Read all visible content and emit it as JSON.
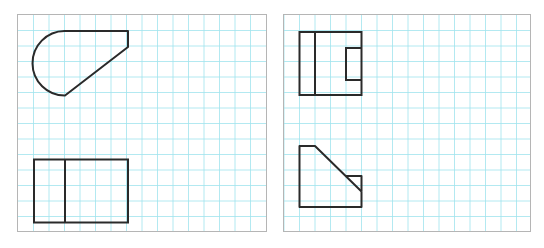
{
  "diagram": {
    "type": "orthographic-projection-views",
    "colors": {
      "grid": "#9fe3ee",
      "outline": "#2a2a2a",
      "border": "#b5b5b5",
      "background": "#ffffff"
    },
    "grid_spacing_px": 15.5,
    "panels": [
      {
        "name": "left-panel",
        "views": [
          {
            "name": "top-view",
            "shape": "semicircle-plus-tapered-wedge"
          },
          {
            "name": "front-view",
            "shape": "rectangle-with-vertical-divider"
          }
        ]
      },
      {
        "name": "right-panel",
        "views": [
          {
            "name": "top-view",
            "shape": "rectangle-with-divider-and-notch"
          },
          {
            "name": "front-view",
            "shape": "pentagon-with-chamfer-and-step"
          }
        ]
      }
    ]
  }
}
